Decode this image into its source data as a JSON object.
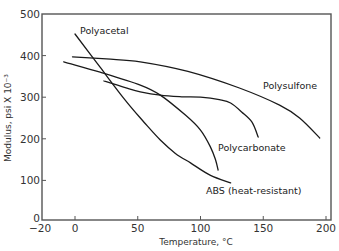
{
  "chart_data": {
    "type": "line",
    "title": "",
    "xlabel": "Temperature, °C",
    "ylabel": "Modulus, psi X 10⁻³",
    "xlim": [
      -26,
      204
    ],
    "ylim": [
      0,
      500
    ],
    "grid": false,
    "legend": "inline labels",
    "x_ticks": [
      -20,
      0,
      50,
      100,
      150,
      200
    ],
    "x_tick_labels": [
      "−20",
      "0",
      "50",
      "100",
      "150",
      "200"
    ],
    "y_ticks": [
      0,
      100,
      200,
      300,
      400,
      500
    ],
    "y_tick_labels": [
      "0",
      "100",
      "200",
      "300",
      "400",
      "500"
    ],
    "series": [
      {
        "name": "Polyacetal",
        "label": "Polyacetal",
        "points": [
          [
            0,
            452
          ],
          [
            20,
            372
          ],
          [
            40,
            293
          ],
          [
            55,
            240
          ],
          [
            68,
            197
          ],
          [
            80,
            165
          ],
          [
            92,
            142
          ],
          [
            108,
            112
          ],
          [
            124,
            94
          ]
        ]
      },
      {
        "name": "Polysulfone",
        "label": "Polysulfone",
        "points": [
          [
            -2,
            397
          ],
          [
            25,
            392
          ],
          [
            52,
            385
          ],
          [
            90,
            362
          ],
          [
            131,
            322
          ],
          [
            163,
            281
          ],
          [
            179,
            250
          ],
          [
            195,
            202
          ]
        ]
      },
      {
        "name": "Polycarbonate",
        "label": "Polycarbonate",
        "points": [
          [
            23,
            339
          ],
          [
            40,
            323
          ],
          [
            52,
            313
          ],
          [
            68,
            305
          ],
          [
            85,
            301
          ],
          [
            100,
            300
          ],
          [
            115,
            294
          ],
          [
            124,
            286
          ],
          [
            133,
            264
          ],
          [
            141,
            240
          ],
          [
            146,
            204
          ]
        ]
      },
      {
        "name": "ABS (heat-resistant)",
        "label": "ABS (heat-resistant)",
        "points": [
          [
            -9,
            385
          ],
          [
            20,
            360
          ],
          [
            52,
            329
          ],
          [
            68,
            305
          ],
          [
            88,
            257
          ],
          [
            100,
            221
          ],
          [
            108,
            180
          ],
          [
            112,
            149
          ],
          [
            114,
            125
          ]
        ]
      }
    ]
  }
}
